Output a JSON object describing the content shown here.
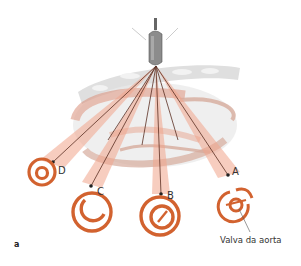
{
  "figure": {
    "panel_label": "a",
    "annotation": "Valva da aorta",
    "probe": {
      "name": "ultrasound transducer"
    },
    "views": [
      {
        "id": "D",
        "label": "D"
      },
      {
        "id": "C",
        "label": "C"
      },
      {
        "id": "B",
        "label": "B"
      },
      {
        "id": "A",
        "label": "A"
      }
    ]
  },
  "colors": {
    "ring": "#d2622f",
    "beam": "#f2b7a3",
    "heart": "#d98a73",
    "line": "#4a2a20",
    "tissue": "#d9d9d9"
  }
}
